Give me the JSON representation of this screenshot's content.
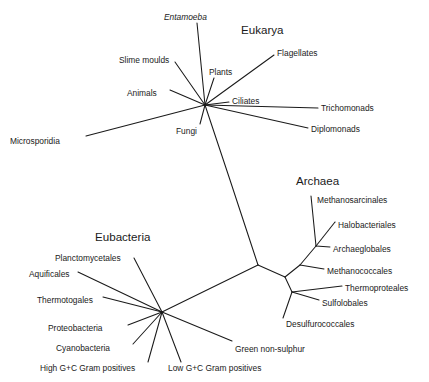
{
  "figure": {
    "type": "unrooted-phylogenetic-tree",
    "background_color": "#ffffff",
    "line_color": "#1a1a1a",
    "text_color": "#1a1a1a"
  },
  "domains": [
    {
      "name": "eukarya",
      "label": "Eukarya",
      "x": 241,
      "y": 24
    },
    {
      "name": "archaea",
      "label": "Archaea",
      "x": 296,
      "y": 175
    },
    {
      "name": "eubacteria",
      "label": "Eubacteria",
      "x": 95,
      "y": 231
    }
  ],
  "taxa": [
    {
      "name": "entamoeba",
      "label": "Entamoeba",
      "italic": true,
      "x": 164,
      "y": 13,
      "anchor": "start"
    },
    {
      "name": "slime-moulds",
      "label": "Slime moulds",
      "x": 119,
      "y": 56,
      "anchor": "start"
    },
    {
      "name": "plants",
      "label": "Plants",
      "x": 209,
      "y": 68,
      "anchor": "start"
    },
    {
      "name": "flagellates",
      "label": "Flagellates",
      "x": 277,
      "y": 49,
      "anchor": "start"
    },
    {
      "name": "animals",
      "label": "Animals",
      "x": 127,
      "y": 89,
      "anchor": "start"
    },
    {
      "name": "ciliates",
      "label": "Ciliates",
      "x": 232,
      "y": 97,
      "anchor": "start"
    },
    {
      "name": "trichomonads",
      "label": "Trichomonads",
      "x": 321,
      "y": 104,
      "anchor": "start"
    },
    {
      "name": "diplomonads",
      "label": "Diplomonads",
      "x": 311,
      "y": 125,
      "anchor": "start"
    },
    {
      "name": "fungi",
      "label": "Fungi",
      "x": 176,
      "y": 127,
      "anchor": "start"
    },
    {
      "name": "microsporidia",
      "label": "Microsporidia",
      "x": 10,
      "y": 137,
      "anchor": "start"
    },
    {
      "name": "methanosarcinales",
      "label": "Methanosarcinales",
      "x": 317,
      "y": 196,
      "anchor": "start"
    },
    {
      "name": "halobacteriales",
      "label": "Halobacteriales",
      "x": 338,
      "y": 221,
      "anchor": "start"
    },
    {
      "name": "archaeglobales",
      "label": "Archaeglobales",
      "x": 333,
      "y": 245,
      "anchor": "start"
    },
    {
      "name": "methanococcales",
      "label": "Methanococcales",
      "x": 327,
      "y": 267,
      "anchor": "start"
    },
    {
      "name": "thermoproteales",
      "label": "Thermoproteales",
      "x": 345,
      "y": 284,
      "anchor": "start"
    },
    {
      "name": "sulfolobales",
      "label": "Sulfolobales",
      "x": 322,
      "y": 299,
      "anchor": "start"
    },
    {
      "name": "desulfurococcales",
      "label": "Desulfurococcales",
      "x": 286,
      "y": 320,
      "anchor": "start"
    },
    {
      "name": "planctomycetales",
      "label": "Planctomycetales",
      "x": 55,
      "y": 254,
      "anchor": "start"
    },
    {
      "name": "aquificales",
      "label": "Aquificales",
      "x": 29,
      "y": 270,
      "anchor": "start"
    },
    {
      "name": "thermotogales",
      "label": "Thermotogales",
      "x": 37,
      "y": 296,
      "anchor": "start"
    },
    {
      "name": "proteobacteria",
      "label": "Proteobacteria",
      "x": 48,
      "y": 324,
      "anchor": "start"
    },
    {
      "name": "cyanobacteria",
      "label": "Cyanobacteria",
      "x": 56,
      "y": 344,
      "anchor": "start"
    },
    {
      "name": "high-gc-gram-positives",
      "label": "High G+C Gram positives",
      "x": 40,
      "y": 364,
      "anchor": "start"
    },
    {
      "name": "low-gc-gram-positives",
      "label": "Low G+C Gram positives",
      "x": 168,
      "y": 364,
      "anchor": "start"
    },
    {
      "name": "green-non-sulphur",
      "label": "Green non-sulphur",
      "x": 235,
      "y": 345,
      "anchor": "start"
    }
  ],
  "tree_data": {
    "nodes": {
      "eukarya_hub": {
        "x": 205,
        "y": 105
      },
      "trunk_center": {
        "x": 258,
        "y": 265
      },
      "eubacteria_hub": {
        "x": 162,
        "y": 312
      },
      "archaea_root": {
        "x": 285,
        "y": 277
      },
      "archaea_upper": {
        "x": 300,
        "y": 265
      },
      "archaea_clade_a": {
        "x": 316,
        "y": 246
      },
      "archaea_lower": {
        "x": 292,
        "y": 292
      }
    },
    "branches": [
      {
        "name": "trunk-eukarya",
        "path": "205,105 230,180 258,265"
      },
      {
        "name": "trunk-eubacteria",
        "path": "258,265 162,312"
      },
      {
        "name": "trunk-archaea",
        "path": "258,265 285,277"
      },
      {
        "name": "euk-entamoeba",
        "path": "205,105 197,23"
      },
      {
        "name": "euk-slime-moulds",
        "path": "205,105 175,62"
      },
      {
        "name": "euk-plants",
        "path": "205,105 214,78"
      },
      {
        "name": "euk-flagellates",
        "path": "205,105 274,55"
      },
      {
        "name": "euk-animals",
        "path": "205,105 170,90"
      },
      {
        "name": "euk-ciliates",
        "path": "205,105 229,102"
      },
      {
        "name": "euk-trichomonads",
        "path": "205,105 318,108"
      },
      {
        "name": "euk-diplomonads",
        "path": "205,105 308,128"
      },
      {
        "name": "euk-fungi",
        "path": "205,105 200,124"
      },
      {
        "name": "euk-microsporidia",
        "path": "205,105 86,136"
      },
      {
        "name": "arch-a-methanosarcinales",
        "path": "316,246 311,196"
      },
      {
        "name": "arch-a-halobacteriales",
        "path": "316,246 335,222"
      },
      {
        "name": "arch-a-archaeglobales",
        "path": "316,246 330,247"
      },
      {
        "name": "arch-upper-link",
        "path": "300,265 316,246"
      },
      {
        "name": "arch-methanococcales",
        "path": "300,265 324,269"
      },
      {
        "name": "arch-root-upper",
        "path": "285,277 300,265"
      },
      {
        "name": "arch-root-lower",
        "path": "285,277 292,292"
      },
      {
        "name": "arch-thermoproteales",
        "path": "292,292 342,286"
      },
      {
        "name": "arch-sulfolobales",
        "path": "292,292 319,300"
      },
      {
        "name": "arch-desulfurococcales",
        "path": "292,292 283,318"
      },
      {
        "name": "eub-planctomycetales",
        "path": "162,312 134,258"
      },
      {
        "name": "eub-aquificales",
        "path": "162,312 78,272"
      },
      {
        "name": "eub-thermotogales",
        "path": "162,312 103,297"
      },
      {
        "name": "eub-proteobacteria",
        "path": "162,312 128,325"
      },
      {
        "name": "eub-cyanobacteria",
        "path": "162,312 133,344"
      },
      {
        "name": "eub-high-gc",
        "path": "162,312 148,362"
      },
      {
        "name": "eub-low-gc",
        "path": "162,312 181,362"
      },
      {
        "name": "eub-green-non-sulphur",
        "path": "162,312 232,341"
      }
    ]
  }
}
